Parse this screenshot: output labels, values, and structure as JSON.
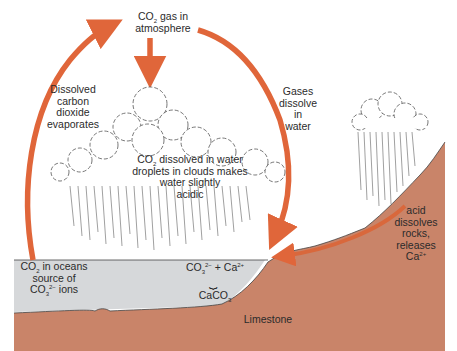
{
  "diagram": {
    "type": "carbon-cycle-limestone",
    "colors": {
      "arrow": "#e0663a",
      "ocean": "#d6d8da",
      "rock": "#c98469",
      "rock_arrow": "#d9683c",
      "cloud_outline": "#555555",
      "rain": "#777777"
    },
    "labels": {
      "atmosphere": {
        "main": "CO",
        "sub": "2",
        "rest": " gas in",
        "line2": "atmosphere"
      },
      "evaporates": {
        "l1": "Dissolved",
        "l2": "carbon",
        "l3": "dioxide",
        "l4": "evaporates"
      },
      "dissolve": {
        "l1": "Gases",
        "l2": "dissolve",
        "l3": "in",
        "l4": "water"
      },
      "cloud": {
        "main": "CO",
        "sub": "2",
        "rest": " dissolved in water",
        "l2": "droplets in clouds makes",
        "l3": "water slightly",
        "l4": "acidic"
      },
      "oceans": {
        "l1a": "CO",
        "l1sub": "2",
        "l1b": " in oceans",
        "l2": "source of",
        "l3a": "CO",
        "l3sub": "3",
        "l3sup": "2−",
        "l3b": " ions"
      },
      "ions": {
        "a": "CO",
        "asub": "3",
        "asup": "2−",
        "plus": " + Ca",
        "bsup": "2+"
      },
      "brace": "⏟",
      "caco3": {
        "a": "CaCO",
        "sub": "3"
      },
      "limestone": "Limestone",
      "acid": {
        "l1": "acid",
        "l2": "dissolves",
        "l3": "rocks,",
        "l4": "releases",
        "l5a": "Ca",
        "l5sup": "2+"
      }
    }
  }
}
